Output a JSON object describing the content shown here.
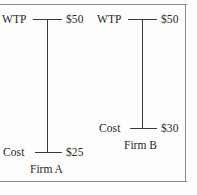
{
  "figure": {
    "frame_color": "#8a8a8a",
    "line_color": "#3a3a3a",
    "text_color": "#262626"
  },
  "chart_data": {
    "type": "diagram",
    "title": "",
    "xlabel": "",
    "ylabel": "",
    "categories": [
      "Firm A",
      "Firm B"
    ],
    "series": [
      {
        "name": "WTP",
        "values": [
          50,
          50
        ]
      },
      {
        "name": "Cost",
        "values": [
          25,
          30
        ]
      }
    ],
    "value_unit": "$",
    "ylim": [
      0,
      55
    ],
    "grid": false,
    "legend": "none"
  },
  "firms": [
    {
      "id": "firm-a",
      "name": "Firm A",
      "wtp_label": "WTP",
      "wtp_value": "$50",
      "cost_label": "Cost",
      "cost_value": "$25"
    },
    {
      "id": "firm-b",
      "name": "Firm B",
      "wtp_label": "WTP",
      "wtp_value": "$50",
      "cost_label": "Cost",
      "cost_value": "$30"
    }
  ]
}
